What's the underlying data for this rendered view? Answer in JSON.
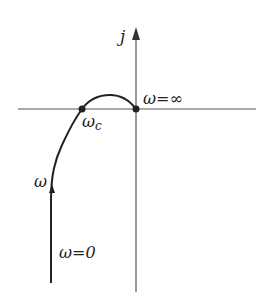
{
  "diagram": {
    "type": "nyquist-plot",
    "axes": {
      "imag_label": "j",
      "real_axis": "horizontal",
      "imag_axis": "vertical"
    },
    "curve": {
      "direction_label": "ω",
      "start_label": "ω=0",
      "crossover_label": "ωc",
      "end_label": "ω=∞"
    },
    "labels": {
      "j": "j",
      "omega": "ω",
      "omega_zero": "ω=0",
      "omega_c_main": "ω",
      "omega_c_sub": "c",
      "omega_inf": "ω=∞"
    },
    "colors": {
      "axis": "#555555",
      "curve": "#222222",
      "text": "#222222"
    }
  }
}
